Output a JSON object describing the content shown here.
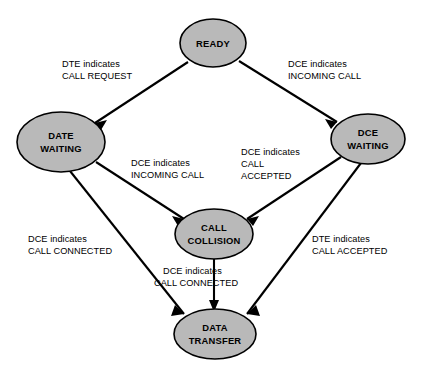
{
  "diagram": {
    "background_color": "#ffffff",
    "node_fill_color": "#b9b9b9",
    "node_stroke_color": "#000000",
    "edge_color": "#000000",
    "nodes": [
      {
        "id": "ready",
        "label_lines": [
          "READY"
        ],
        "cx": 213,
        "cy": 43,
        "rx": 33,
        "ry": 24
      },
      {
        "id": "date-waiting",
        "label_lines": [
          "DATE",
          "WAITING"
        ],
        "cx": 61,
        "cy": 142,
        "rx": 44,
        "ry": 30
      },
      {
        "id": "dce-waiting",
        "label_lines": [
          "DCE",
          "WAITING"
        ],
        "cx": 368,
        "cy": 139,
        "rx": 37,
        "ry": 25
      },
      {
        "id": "call-collision",
        "label_lines": [
          "CALL",
          "COLLISION"
        ],
        "cx": 214,
        "cy": 234,
        "rx": 39,
        "ry": 25
      },
      {
        "id": "data-transfer",
        "label_lines": [
          "DATA",
          "TRANSFER"
        ],
        "cx": 215,
        "cy": 334,
        "rx": 41,
        "ry": 25
      }
    ],
    "edges": [
      {
        "id": "ready-to-date-waiting",
        "from": "ready",
        "to": "date-waiting",
        "label_lines": [
          "DTE indicates",
          "CALL REQUEST"
        ],
        "label_x": 62,
        "label_y": 63,
        "label_align": "start"
      },
      {
        "id": "ready-to-dce-waiting",
        "from": "ready",
        "to": "dce-waiting",
        "label_lines": [
          "DCE indicates",
          "INCOMING CALL"
        ],
        "label_x": 283,
        "label_y": 63,
        "label_align": "start"
      },
      {
        "id": "date-waiting-to-call-collision",
        "from": "date-waiting",
        "to": "call-collision",
        "label_lines": [
          "DCE indicates",
          "INCOMING CALL"
        ],
        "label_x": 131,
        "label_y": 163,
        "label_align": "start"
      },
      {
        "id": "dce-waiting-to-call-collision",
        "from": "dce-waiting",
        "to": "call-collision",
        "label_lines": [
          "DCE indicates",
          "CALL",
          "ACCEPTED"
        ],
        "label_x": 241,
        "label_y": 152,
        "label_align": "start"
      },
      {
        "id": "date-waiting-to-data-transfer",
        "from": "date-waiting",
        "to": "data-transfer",
        "label_lines": [
          "DCE indicates",
          "CALL CONNECTED"
        ],
        "label_x": 28,
        "label_y": 239,
        "label_align": "start"
      },
      {
        "id": "dce-waiting-to-data-transfer",
        "from": "dce-waiting",
        "to": "data-transfer",
        "label_lines": [
          "DTE indicates",
          "CALL ACCEPTED"
        ],
        "label_x": 312,
        "label_y": 239,
        "label_align": "start"
      },
      {
        "id": "call-collision-to-data-transfer",
        "from": "call-collision",
        "to": "data-transfer",
        "label_lines": [
          "DCE indicates",
          "CALL CONNECTED"
        ],
        "label_x": 160,
        "label_y": 271,
        "label_align": "start"
      }
    ]
  }
}
